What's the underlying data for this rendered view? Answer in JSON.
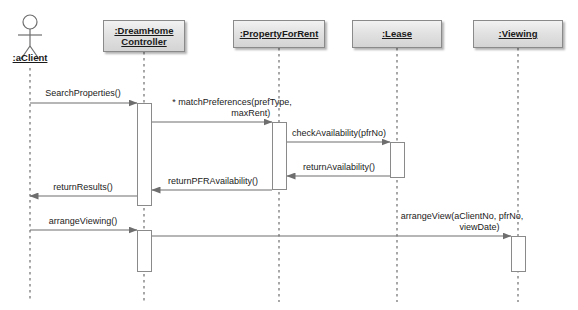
{
  "diagram": {
    "type": "uml-sequence-diagram",
    "title": "",
    "canvas": {
      "width": 578,
      "height": 310
    },
    "colors": {
      "box_border": "#8a8a8a",
      "box_fill_top": "#f2f2f2",
      "box_fill_bottom": "#d4d4d4",
      "line": "#6e6e6e",
      "text": "#1a1a1a",
      "background": "#ffffff"
    },
    "actor": {
      "name": "actor-aclient",
      "label": ":aClient",
      "x": 30,
      "head_cy": 22,
      "head_r": 7,
      "lifeline_top": 68,
      "lifeline_bottom": 302
    },
    "lifelines": [
      {
        "name": "lifeline-dreamhome-controller",
        "label_lines": [
          ":DreamHome",
          "Controller"
        ],
        "box": {
          "x": 103,
          "y": 20,
          "w": 82,
          "h": 32
        },
        "center_x": 144,
        "lifeline_top": 52,
        "lifeline_bottom": 302
      },
      {
        "name": "lifeline-propertyforrent",
        "label_lines": [
          ":PropertyForRent"
        ],
        "box": {
          "x": 233,
          "y": 20,
          "w": 92,
          "h": 28
        },
        "center_x": 279,
        "lifeline_top": 48,
        "lifeline_bottom": 302
      },
      {
        "name": "lifeline-lease",
        "label_lines": [
          ":Lease"
        ],
        "box": {
          "x": 352,
          "y": 20,
          "w": 90,
          "h": 28
        },
        "center_x": 397,
        "lifeline_top": 48,
        "lifeline_bottom": 302
      },
      {
        "name": "lifeline-viewing",
        "label_lines": [
          ":Viewing"
        ],
        "box": {
          "x": 473,
          "y": 20,
          "w": 90,
          "h": 28
        },
        "center_x": 518,
        "lifeline_top": 48,
        "lifeline_bottom": 302
      }
    ],
    "activations": [
      {
        "name": "activation-controller-search",
        "x": 137,
        "y": 103,
        "w": 15,
        "h": 103
      },
      {
        "name": "activation-propertyforrent-match",
        "x": 272,
        "y": 122,
        "w": 15,
        "h": 68
      },
      {
        "name": "activation-lease-check",
        "x": 390,
        "y": 142,
        "w": 15,
        "h": 36
      },
      {
        "name": "activation-controller-arrange",
        "x": 137,
        "y": 230,
        "w": 15,
        "h": 42
      },
      {
        "name": "activation-viewing-arrange",
        "x": 511,
        "y": 236,
        "w": 15,
        "h": 36
      }
    ],
    "messages": [
      {
        "name": "message-searchproperties",
        "label": "SearchProperties()",
        "kind": "call",
        "from_x": 30,
        "to_x": 137,
        "y": 103,
        "label_x": 83,
        "label_y": 88,
        "label_align": "center"
      },
      {
        "name": "message-matchpreferences",
        "label": "* matchPreferences(prefType,\n               maxRent)",
        "kind": "call",
        "from_x": 152,
        "to_x": 272,
        "y": 122,
        "label_x": 232,
        "label_y": 97,
        "label_align": "center"
      },
      {
        "name": "message-checkavailability",
        "label": "checkAvailability(pfrNo)",
        "kind": "call",
        "from_x": 287,
        "to_x": 390,
        "y": 142,
        "label_x": 339,
        "label_y": 128,
        "label_align": "center"
      },
      {
        "name": "message-returnavailability",
        "label": "returnAvailability()",
        "kind": "return",
        "from_x": 390,
        "to_x": 287,
        "y": 176,
        "label_x": 339,
        "label_y": 162,
        "label_align": "center"
      },
      {
        "name": "message-returnpfravailability",
        "label": "returnPFRAvailability()",
        "kind": "return",
        "from_x": 272,
        "to_x": 152,
        "y": 190,
        "label_x": 213,
        "label_y": 176,
        "label_align": "center"
      },
      {
        "name": "message-returnresults",
        "label": "returnResults()",
        "kind": "return",
        "from_x": 137,
        "to_x": 30,
        "y": 196,
        "label_x": 83,
        "label_y": 182,
        "label_align": "center"
      },
      {
        "name": "message-arrangeviewing",
        "label": "arrangeViewing()",
        "kind": "call",
        "from_x": 30,
        "to_x": 137,
        "y": 230,
        "label_x": 83,
        "label_y": 216,
        "label_align": "center"
      },
      {
        "name": "message-arrangeview",
        "label": "arrangeView(aClientNo, pfrNo,\n              viewDate)",
        "kind": "call",
        "from_x": 152,
        "to_x": 511,
        "y": 236,
        "label_x": 462,
        "label_y": 211,
        "label_align": "center"
      }
    ]
  }
}
